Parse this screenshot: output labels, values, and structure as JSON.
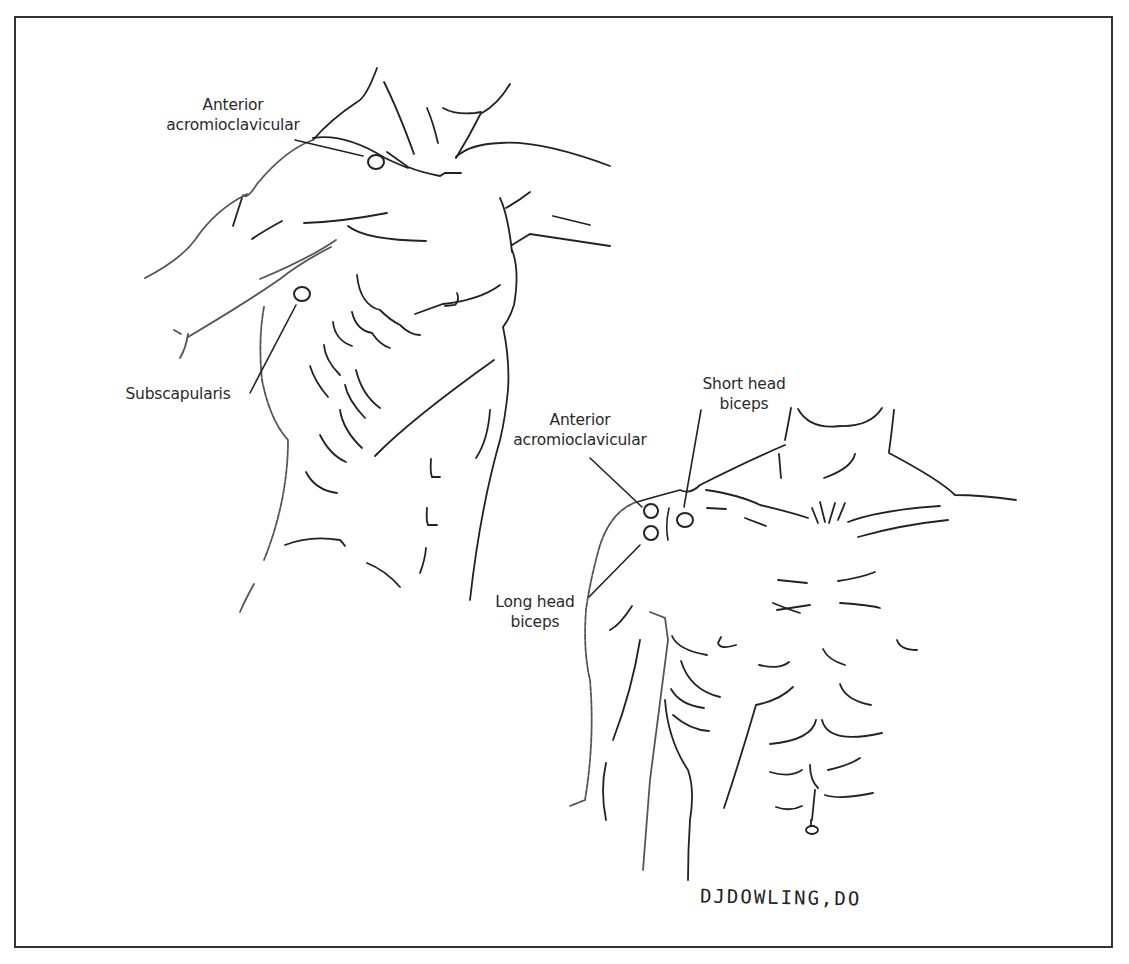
{
  "figure": {
    "border_color": "#333333",
    "line_color": "#222222",
    "figures": [
      {
        "name": "upper-left-torso",
        "labels": [
          {
            "id": "anterior-acromioclavicular-1",
            "line1": "Anterior",
            "line2": "acromioclavicular"
          },
          {
            "id": "subscapularis",
            "line1": "Subscapularis"
          }
        ]
      },
      {
        "name": "lower-right-torso",
        "labels": [
          {
            "id": "anterior-acromioclavicular-2",
            "line1": "Anterior",
            "line2": "acromioclavicular"
          },
          {
            "id": "short-head-biceps",
            "line1": "Short head",
            "line2": "biceps"
          },
          {
            "id": "long-head-biceps",
            "line1": "Long head",
            "line2": "biceps"
          }
        ]
      }
    ],
    "signature": "DJDOWLING,DO"
  }
}
